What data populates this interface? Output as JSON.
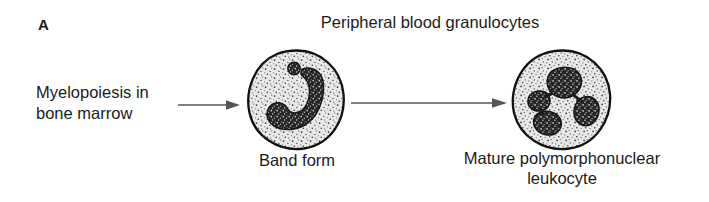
{
  "figure": {
    "panel_letter": "A",
    "headline": "Peripheral blood granulocytes",
    "colors": {
      "ink": "#1a1a1a",
      "background": "#ffffff",
      "cytoplasm_fill": "#e8e8e6",
      "nucleus_fill": "#2a2a2a",
      "membrane_stroke": "#111111",
      "arrow_stroke": "#555555",
      "stipple": "#3a3a3a"
    }
  },
  "source": {
    "line1": "Myelopoiesis in",
    "line2": "bone marrow"
  },
  "arrows": [
    {
      "name": "arrow-marrow-to-band",
      "from": "Myelopoiesis in bone marrow",
      "to": "Band form"
    },
    {
      "name": "arrow-band-to-mature",
      "from": "Band form",
      "to": "Mature polymorphonuclear leukocyte"
    }
  ],
  "cells": [
    {
      "id": "band-form",
      "caption": "Band form",
      "nucleus_shape": "band",
      "lobes": 1
    },
    {
      "id": "mature-pmn",
      "caption_line1": "Mature polymorphonuclear",
      "caption_line2": "leukocyte",
      "nucleus_shape": "multilobed",
      "lobes": 4
    }
  ]
}
